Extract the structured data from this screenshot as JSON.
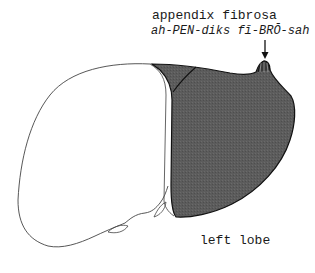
{
  "labels": {
    "structure": "appendix fibrosa",
    "pronunciation": "ah-PEN-diks fī-BRŌ-sah",
    "region": "left lobe"
  },
  "colors": {
    "shaded_lobe": "#5a5a5a",
    "outline": "#111111",
    "background": "#ffffff"
  },
  "annotations": [
    {
      "type": "arrow",
      "points_to": "appendix fibrosa"
    }
  ]
}
